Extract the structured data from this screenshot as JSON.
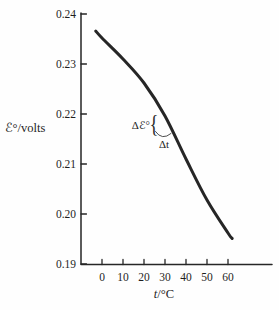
{
  "figure": {
    "background": "#fefefe",
    "ink_color": "#262626"
  },
  "chart_data": {
    "type": "line",
    "title": "",
    "xlabel": "t/°C",
    "ylabel": "ℰ°/volts",
    "xlim": [
      -5,
      81
    ],
    "ylim": [
      0.19,
      0.24
    ],
    "xticks": [
      0,
      10,
      20,
      30,
      40,
      50,
      60
    ],
    "yticks": [
      0.19,
      0.2,
      0.21,
      0.22,
      0.23,
      0.24
    ],
    "grid": false,
    "legend": "none",
    "series": [
      {
        "name": "standard-emf-vs-temperature",
        "x": [
          -3,
          0,
          10,
          20,
          30,
          40,
          50,
          60,
          62
        ],
        "y": [
          0.2366,
          0.2352,
          0.231,
          0.2262,
          0.2196,
          0.211,
          0.2028,
          0.1962,
          0.1951
        ]
      }
    ],
    "annotations": [
      {
        "text": "Δℰ°",
        "near_t": 27,
        "near_E": 0.2185
      },
      {
        "text": "Δt",
        "near_t": 30,
        "near_E": 0.2135
      }
    ]
  },
  "labels": {
    "ylabel_symbol": "ℰ°",
    "ylabel_unit": "/volts",
    "xlabel_symbol": "t",
    "xlabel_unit": "/°C",
    "yticks": [
      "0.24",
      "0.23",
      "0.22",
      "0.21",
      "0.20",
      "0.19"
    ],
    "xticks": [
      "0",
      "10",
      "20",
      "30",
      "40",
      "50",
      "60"
    ],
    "annotation_dE": "Δℰ°",
    "annotation_brace": "{",
    "annotation_dt": "Δt"
  }
}
